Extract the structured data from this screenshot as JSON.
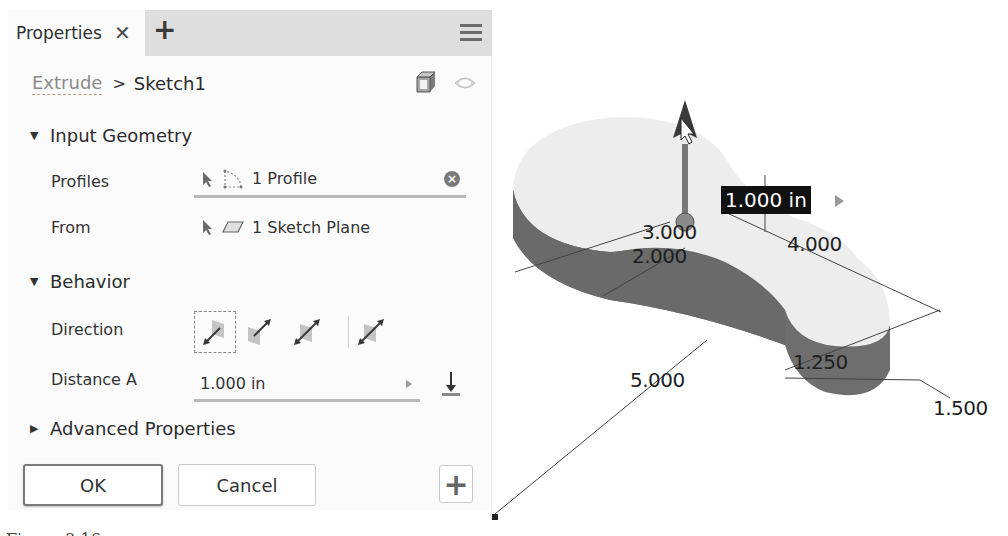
{
  "panel": {
    "tab_title": "Properties",
    "close_glyph": "✕",
    "add_tab_glyph": "+",
    "menu_icon": "hamburger-menu-icon",
    "breadcrumb": {
      "parent": "Extrude",
      "separator": ">",
      "current": "Sketch1"
    },
    "header_icons": [
      "body-icon",
      "eye-icon"
    ]
  },
  "sections": {
    "input_geometry": {
      "label": "Input Geometry",
      "expanded": true,
      "profiles": {
        "label": "Profiles",
        "value": "1 Profile",
        "icons": [
          "select-cursor-icon",
          "profile-icon"
        ],
        "clear_glyph": "×"
      },
      "from": {
        "label": "From",
        "value": "1 Sketch Plane",
        "icons": [
          "select-cursor-icon",
          "plane-icon"
        ]
      }
    },
    "behavior": {
      "label": "Behavior",
      "expanded": true,
      "direction": {
        "label": "Direction",
        "options": [
          "default-direction",
          "flipped-direction",
          "symmetric-direction",
          "asymmetric-direction"
        ],
        "selected_index": 0
      },
      "distance_a": {
        "label": "Distance A",
        "value": "1.000 in",
        "flip_icon": "flip-direction-icon"
      }
    },
    "advanced": {
      "label": "Advanced Properties",
      "expanded": false
    }
  },
  "buttons": {
    "ok": "OK",
    "cancel": "Cancel",
    "add": "+"
  },
  "viewport": {
    "distance_badge": "1.000 in",
    "dimensions": {
      "d1": "3.000",
      "d2": "2.000",
      "d3": "4.000",
      "d4": "5.000",
      "d5": "1.250",
      "d6": "1.500"
    },
    "colors": {
      "top_face": "#ededed",
      "side_face": "#6e6e6e",
      "badge_bg": "#111111"
    }
  },
  "caption": "Figure 3-16"
}
